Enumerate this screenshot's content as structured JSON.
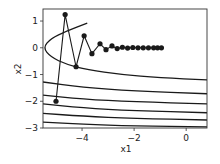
{
  "chart_data": {
    "type": "line",
    "title": "",
    "xlabel": "x1",
    "ylabel": "x2",
    "xlim": [
      -5.5,
      0.8
    ],
    "ylim": [
      -3.0,
      1.45
    ],
    "xticks": [
      -4,
      -2,
      0
    ],
    "yticks": [
      1,
      0,
      -1,
      -2,
      -3
    ],
    "xtick_labels": [
      "−4",
      "−2",
      "0"
    ],
    "ytick_labels": [
      "1",
      "0",
      "−1",
      "−2",
      "−3"
    ],
    "grid": false,
    "legend": null,
    "series": [
      {
        "name": "trajectory",
        "marker": "circle",
        "color": "#1a1a1a",
        "points": [
          [
            -5.0,
            -2.0
          ],
          [
            -4.65,
            1.24
          ],
          [
            -4.23,
            -0.71
          ],
          [
            -3.92,
            0.45
          ],
          [
            -3.62,
            -0.22
          ],
          [
            -3.31,
            0.15
          ],
          [
            -3.08,
            -0.07
          ],
          [
            -2.85,
            0.07
          ],
          [
            -2.65,
            -0.03
          ],
          [
            -2.45,
            0.02
          ],
          [
            -2.25,
            -0.01
          ],
          [
            -2.05,
            0.01
          ],
          [
            -1.85,
            0.0
          ],
          [
            -1.65,
            0.0
          ],
          [
            -1.45,
            0.0
          ],
          [
            -1.25,
            0.0
          ],
          [
            -1.1,
            0.0
          ],
          [
            -0.95,
            0.0
          ]
        ]
      }
    ],
    "contours": [
      {
        "name": "contour-1",
        "points": [
          [
            -3.8,
            0.92
          ],
          [
            -4.6,
            0.62
          ],
          [
            -5.2,
            0.35
          ],
          [
            -5.5,
            0.0
          ],
          [
            -5.2,
            -0.35
          ],
          [
            -4.6,
            -0.62
          ],
          [
            -3.8,
            -0.82
          ],
          [
            -2.5,
            -1.0
          ],
          [
            -1.0,
            -1.12
          ],
          [
            0.8,
            -1.2
          ]
        ]
      },
      {
        "name": "contour-2",
        "points": [
          [
            -5.5,
            -1.28
          ],
          [
            -4.0,
            -1.48
          ],
          [
            -2.0,
            -1.62
          ],
          [
            0.8,
            -1.72
          ]
        ]
      },
      {
        "name": "contour-3",
        "points": [
          [
            -5.5,
            -1.77
          ],
          [
            -4.0,
            -1.92
          ],
          [
            -2.0,
            -2.02
          ],
          [
            0.8,
            -2.1
          ]
        ]
      },
      {
        "name": "contour-4",
        "points": [
          [
            -5.5,
            -2.1
          ],
          [
            -4.0,
            -2.25
          ],
          [
            -2.0,
            -2.35
          ],
          [
            0.8,
            -2.43
          ]
        ]
      },
      {
        "name": "contour-5",
        "points": [
          [
            -5.5,
            -2.45
          ],
          [
            -4.0,
            -2.56
          ],
          [
            -2.0,
            -2.64
          ],
          [
            0.8,
            -2.7
          ]
        ]
      },
      {
        "name": "contour-6",
        "points": [
          [
            -5.5,
            -2.78
          ],
          [
            -4.0,
            -2.86
          ],
          [
            -2.0,
            -2.92
          ],
          [
            0.8,
            -2.96
          ]
        ]
      }
    ]
  },
  "axes": {
    "xlabel": "x1",
    "ylabel": "x2"
  }
}
